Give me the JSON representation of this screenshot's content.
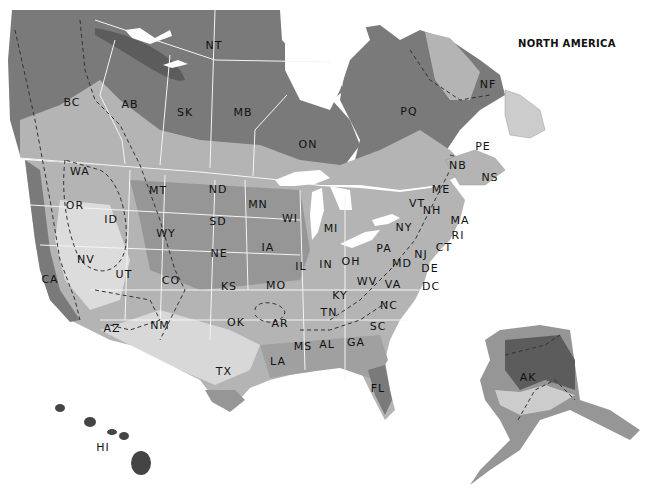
{
  "map": {
    "title": "NORTH AMERICA",
    "colors": {
      "water": "#ffffff",
      "darkest": "#5c5c5c",
      "dark": "#7a7a7a",
      "mid": "#969696",
      "light": "#b4b4b4",
      "lighter": "#cccccc",
      "lightest": "#e0e0e0",
      "border": "#f4f4f4",
      "label": "#111111"
    },
    "regions": {
      "canada": [
        {
          "code": "NT",
          "x": 214,
          "y": 45
        },
        {
          "code": "BC",
          "x": 72,
          "y": 102
        },
        {
          "code": "AB",
          "x": 130,
          "y": 104
        },
        {
          "code": "SK",
          "x": 185,
          "y": 112
        },
        {
          "code": "MB",
          "x": 243,
          "y": 112
        },
        {
          "code": "ON",
          "x": 308,
          "y": 144
        },
        {
          "code": "PQ",
          "x": 409,
          "y": 111
        },
        {
          "code": "NF",
          "x": 488,
          "y": 84
        },
        {
          "code": "PE",
          "x": 483,
          "y": 146
        },
        {
          "code": "NB",
          "x": 458,
          "y": 165
        },
        {
          "code": "NS",
          "x": 490,
          "y": 177
        }
      ],
      "usa": [
        {
          "code": "WA",
          "x": 80,
          "y": 171
        },
        {
          "code": "OR",
          "x": 75,
          "y": 205
        },
        {
          "code": "ID",
          "x": 111,
          "y": 219
        },
        {
          "code": "MT",
          "x": 158,
          "y": 190
        },
        {
          "code": "WY",
          "x": 166,
          "y": 233
        },
        {
          "code": "ND",
          "x": 218,
          "y": 189
        },
        {
          "code": "SD",
          "x": 218,
          "y": 221
        },
        {
          "code": "NE",
          "x": 219,
          "y": 253
        },
        {
          "code": "MN",
          "x": 258,
          "y": 204
        },
        {
          "code": "WI",
          "x": 290,
          "y": 218
        },
        {
          "code": "MI",
          "x": 331,
          "y": 228
        },
        {
          "code": "IA",
          "x": 268,
          "y": 247
        },
        {
          "code": "IL",
          "x": 301,
          "y": 266
        },
        {
          "code": "IN",
          "x": 326,
          "y": 264
        },
        {
          "code": "OH",
          "x": 351,
          "y": 261
        },
        {
          "code": "NV",
          "x": 86,
          "y": 259
        },
        {
          "code": "UT",
          "x": 124,
          "y": 274
        },
        {
          "code": "CO",
          "x": 171,
          "y": 280
        },
        {
          "code": "KS",
          "x": 229,
          "y": 286
        },
        {
          "code": "MO",
          "x": 276,
          "y": 285
        },
        {
          "code": "CA",
          "x": 50,
          "y": 279
        },
        {
          "code": "AZ",
          "x": 112,
          "y": 328
        },
        {
          "code": "NM",
          "x": 160,
          "y": 325
        },
        {
          "code": "OK",
          "x": 236,
          "y": 322
        },
        {
          "code": "AR",
          "x": 280,
          "y": 323
        },
        {
          "code": "TX",
          "x": 224,
          "y": 371
        },
        {
          "code": "LA",
          "x": 278,
          "y": 361
        },
        {
          "code": "MS",
          "x": 303,
          "y": 346
        },
        {
          "code": "AL",
          "x": 327,
          "y": 344
        },
        {
          "code": "GA",
          "x": 356,
          "y": 342
        },
        {
          "code": "FL",
          "x": 378,
          "y": 388
        },
        {
          "code": "TN",
          "x": 329,
          "y": 312
        },
        {
          "code": "KY",
          "x": 340,
          "y": 295
        },
        {
          "code": "WV",
          "x": 367,
          "y": 281
        },
        {
          "code": "VA",
          "x": 393,
          "y": 284
        },
        {
          "code": "NC",
          "x": 389,
          "y": 305
        },
        {
          "code": "SC",
          "x": 378,
          "y": 326
        },
        {
          "code": "PA",
          "x": 384,
          "y": 248
        },
        {
          "code": "NY",
          "x": 404,
          "y": 227
        },
        {
          "code": "VT",
          "x": 417,
          "y": 203
        },
        {
          "code": "NH",
          "x": 432,
          "y": 210
        },
        {
          "code": "ME",
          "x": 441,
          "y": 189
        },
        {
          "code": "MA",
          "x": 460,
          "y": 220
        },
        {
          "code": "RI",
          "x": 458,
          "y": 235
        },
        {
          "code": "CT",
          "x": 444,
          "y": 247
        },
        {
          "code": "NJ",
          "x": 421,
          "y": 254
        },
        {
          "code": "MD",
          "x": 402,
          "y": 263
        },
        {
          "code": "DE",
          "x": 430,
          "y": 268
        },
        {
          "code": "DC",
          "x": 431,
          "y": 286
        },
        {
          "code": "AK",
          "x": 528,
          "y": 377
        },
        {
          "code": "HI",
          "x": 103,
          "y": 447
        }
      ]
    }
  }
}
